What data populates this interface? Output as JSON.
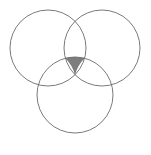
{
  "figure": {
    "name": "three-circle-venn-diagram",
    "type": "venn-diagram",
    "width": 151,
    "height": 155,
    "background_color": "#ffffff",
    "stroke_color": "#6b6b6b",
    "stroke_width": 0.9,
    "shaded_fill_color": "#7d7d7d",
    "shaded_region": "triple-intersection",
    "circle_count": 3
  },
  "circles": [
    {
      "name": "top-left-circle",
      "cx": 48,
      "cy": 48,
      "r": 38,
      "fill": "none",
      "stroke": "#6b6b6b"
    },
    {
      "name": "top-right-circle",
      "cx": 102,
      "cy": 48,
      "r": 38,
      "fill": "none",
      "stroke": "#6b6b6b"
    },
    {
      "name": "bottom-center-circle",
      "cx": 75,
      "cy": 95,
      "r": 38,
      "fill": "none",
      "stroke": "#6b6b6b"
    }
  ],
  "shaded": {
    "name": "triple-overlap-region",
    "fill": "#7d7d7d",
    "vertex_top_left": {
      "x": 60,
      "y": 57
    },
    "vertex_top_right": {
      "x": 90,
      "y": 57
    },
    "vertex_bottom": {
      "x": 75,
      "y": 89
    },
    "arc_radius": 38
  },
  "labels": {
    "caption": "",
    "circle_labels": []
  }
}
